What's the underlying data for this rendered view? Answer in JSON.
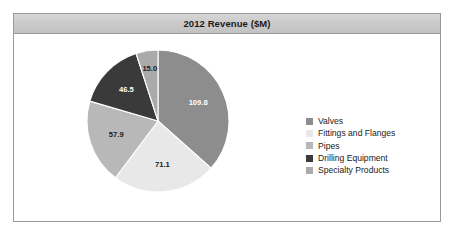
{
  "chart": {
    "title": "2012 Revenue ($M)"
  },
  "chart_data": {
    "type": "pie",
    "title": "2012 Revenue ($M)",
    "xlabel": "",
    "ylabel": "",
    "grid": false,
    "legend_position": "right",
    "units": "$M",
    "total": 300.3,
    "start_angle_deg": 0,
    "direction": "clockwise",
    "categories": [
      "Valves",
      "Fittings and Flanges",
      "Pipes",
      "Drilling Equipment",
      "Specialty Products"
    ],
    "values": [
      109.8,
      71.1,
      57.9,
      46.5,
      15.0
    ],
    "labels": [
      "109.8",
      "71.1",
      "57.9",
      "46.5",
      "15.0"
    ],
    "colors": [
      "#8d8d8d",
      "#e8e8e8",
      "#b8b8b8",
      "#3a3a3a",
      "#aaaaaa"
    ],
    "label_colors": [
      "#ffffff",
      "#1b1b1b",
      "#1b1b1b",
      "#ffffff",
      "#1b1b1b"
    ],
    "slices": [
      {
        "name": "Valves",
        "value": 109.8,
        "label": "109.8",
        "color": "#8d8d8d",
        "label_color": "#ffffff"
      },
      {
        "name": "Fittings and Flanges",
        "value": 71.1,
        "label": "71.1",
        "color": "#e8e8e8",
        "label_color": "#1b1b1b"
      },
      {
        "name": "Pipes",
        "value": 57.9,
        "label": "57.9",
        "color": "#b8b8b8",
        "label_color": "#1b1b1b"
      },
      {
        "name": "Drilling Equipment",
        "value": 46.5,
        "label": "46.5",
        "color": "#3a3a3a",
        "label_color": "#ffffff"
      },
      {
        "name": "Specialty Products",
        "value": 15.0,
        "label": "15.0",
        "color": "#aaaaaa",
        "label_color": "#1b1b1b"
      }
    ]
  },
  "legend": {
    "items": [
      {
        "label": "Valves",
        "color": "#8d8d8d"
      },
      {
        "label": "Fittings and Flanges",
        "color": "#e8e8e8"
      },
      {
        "label": "Pipes",
        "color": "#b8b8b8"
      },
      {
        "label": "Drilling Equipment",
        "color": "#3a3a3a"
      },
      {
        "label": "Specialty Products",
        "color": "#aaaaaa"
      }
    ]
  }
}
